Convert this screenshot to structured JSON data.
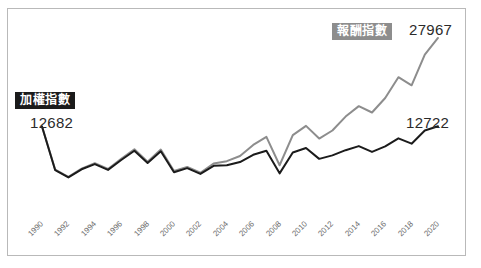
{
  "figure": {
    "background_color": "#ffffff",
    "frame_color": "#b9b9b9"
  },
  "annotations": {
    "weighted_badge_label": "加權指數",
    "weighted_badge_bg": "#1b1b1b",
    "weighted_badge_fg": "#ffffff",
    "weighted_start_value": "12682",
    "weighted_end_value": "12722",
    "return_badge_label": "報酬指數",
    "return_badge_bg": "#8d8d8d",
    "return_badge_fg": "#ffffff",
    "return_end_value": "27967"
  },
  "chart_data": {
    "type": "line",
    "title": "",
    "subtitle": "",
    "xlabel": "",
    "ylabel": "",
    "grid": false,
    "legend_position": "inline-labels",
    "xlim": [
      1990,
      2020
    ],
    "ylim": [
      0,
      29000
    ],
    "tick_label_rotation": -45,
    "x": [
      1990,
      1991,
      1992,
      1993,
      1994,
      1995,
      1996,
      1997,
      1998,
      1999,
      2000,
      2001,
      2002,
      2003,
      2004,
      2005,
      2006,
      2007,
      2008,
      2009,
      2010,
      2011,
      2012,
      2013,
      2014,
      2015,
      2016,
      2017,
      2018,
      2019,
      2020
    ],
    "xtick_labels": [
      "1990",
      "1992",
      "1994",
      "1996",
      "1998",
      "2000",
      "2002",
      "2004",
      "2006",
      "2008",
      "2010",
      "2012",
      "2014",
      "2016",
      "2018",
      "2020"
    ],
    "xtick_values": [
      1990,
      1992,
      1994,
      1996,
      1998,
      2000,
      2002,
      2004,
      2006,
      2008,
      2010,
      2012,
      2014,
      2016,
      2018,
      2020
    ],
    "series": [
      {
        "name": "加權指數",
        "color": "#1b1b1b",
        "width": 2.0,
        "values": [
          12682,
          5150,
          3900,
          5300,
          6200,
          5200,
          6900,
          8500,
          6400,
          8400,
          4800,
          5500,
          4500,
          5900,
          6000,
          6550,
          7800,
          8500,
          4600,
          8200,
          8970,
          7100,
          7700,
          8600,
          9300,
          8300,
          9250,
          10640,
          9720,
          12000,
          12722
        ]
      },
      {
        "name": "報酬指數",
        "color": "#8d8d8d",
        "width": 2.0,
        "values": [
          12682,
          5250,
          4000,
          5400,
          6350,
          5350,
          7100,
          8750,
          6600,
          8700,
          5000,
          5700,
          4700,
          6300,
          6700,
          7600,
          9500,
          10900,
          6000,
          11200,
          12800,
          10600,
          12000,
          14400,
          16200,
          15100,
          17600,
          21200,
          19800,
          25100,
          27967
        ]
      }
    ]
  }
}
